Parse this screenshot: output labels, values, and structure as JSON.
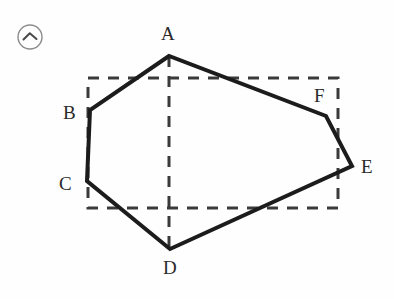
{
  "figure": {
    "badge": {
      "icon": "caret-up-in-circle-icon",
      "circle_color": "#8c8c8c"
    },
    "background_color": "#fefefe",
    "solid_stroke_color": "#1c1c1c",
    "solid_stroke_width": 4,
    "dashed_stroke_color": "#3a3a3a",
    "dashed_stroke_width": 3,
    "dash_pattern": "11 9",
    "vertices": [
      {
        "id": "A",
        "label": "A",
        "x": 169,
        "y": 56,
        "label_x": 161,
        "label_y": 24
      },
      {
        "id": "B",
        "label": "B",
        "x": 90,
        "y": 110,
        "label_x": 63,
        "label_y": 103
      },
      {
        "id": "C",
        "label": "C",
        "x": 87,
        "y": 181,
        "label_x": 59,
        "label_y": 174
      },
      {
        "id": "D",
        "label": "D",
        "x": 170,
        "y": 249,
        "label_x": 163,
        "label_y": 258
      },
      {
        "id": "E",
        "label": "E",
        "x": 352,
        "y": 166,
        "label_x": 361,
        "label_y": 157
      },
      {
        "id": "F",
        "label": "F",
        "x": 326,
        "y": 116,
        "label_x": 314,
        "label_y": 86
      }
    ],
    "polygon_path": "169,56 90,110 87,181 170,249 352,166 326,116",
    "dashed_rectangle": {
      "left": 88,
      "top": 78,
      "right": 338,
      "bottom": 208
    },
    "dashed_vertical_line": {
      "x": 169,
      "top": 56,
      "bottom": 249
    }
  }
}
